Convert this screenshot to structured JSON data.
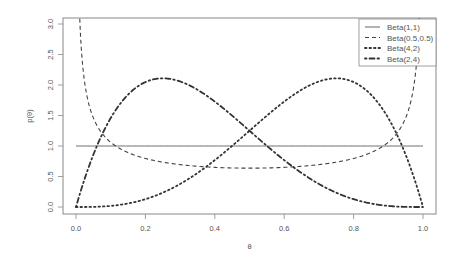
{
  "chart_data": {
    "type": "line",
    "title": "",
    "xlabel": "θ",
    "ylabel": "p(θ)",
    "xlim": [
      0,
      1
    ],
    "ylim": [
      0,
      3
    ],
    "x_ticks": [
      "0.0",
      "0.2",
      "0.4",
      "0.6",
      "0.8",
      "1.0"
    ],
    "y_ticks": [
      "0.0",
      "0.5",
      "1.0",
      "1.5",
      "2.0",
      "2.5",
      "3.0"
    ],
    "grid": false,
    "legend_position": "top-right",
    "series": [
      {
        "name": "Beta(1,1)",
        "alpha": 1,
        "beta": 1,
        "line_style": "solid",
        "color": "#555555",
        "x": [
          0,
          0.25,
          0.5,
          0.75,
          1
        ],
        "values": [
          1,
          1,
          1,
          1,
          1
        ]
      },
      {
        "name": "Beta(0.5,0.5)",
        "alpha": 0.5,
        "beta": 0.5,
        "line_style": "dashed",
        "color": "#444444",
        "x": [
          0.01,
          0.05,
          0.1,
          0.25,
          0.5,
          0.75,
          0.9,
          0.95,
          0.99
        ],
        "values": [
          3.2,
          1.46,
          1.06,
          0.74,
          0.64,
          0.74,
          1.06,
          1.46,
          3.2
        ]
      },
      {
        "name": "Beta(4,2)",
        "alpha": 4,
        "beta": 2,
        "line_style": "dotted",
        "color": "#333333",
        "x": [
          0,
          0.2,
          0.4,
          0.6,
          0.75,
          0.8,
          1.0
        ],
        "values": [
          0,
          0.128,
          0.768,
          1.728,
          2.109,
          2.048,
          0
        ]
      },
      {
        "name": "Beta(2,4)",
        "alpha": 2,
        "beta": 4,
        "line_style": "dashdot",
        "color": "#333333",
        "x": [
          0,
          0.2,
          0.25,
          0.4,
          0.6,
          0.8,
          1.0
        ],
        "values": [
          0,
          2.048,
          2.109,
          1.728,
          0.768,
          0.128,
          0
        ]
      }
    ]
  }
}
